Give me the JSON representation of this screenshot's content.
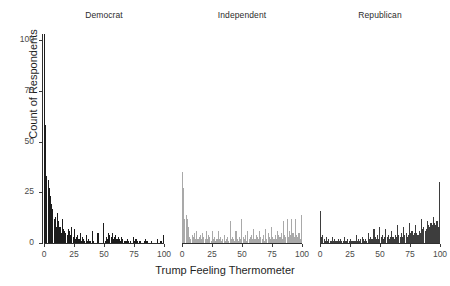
{
  "chart_data": {
    "type": "bar",
    "title": "",
    "xlabel": "Trump Feeling Thermometer",
    "ylabel": "Count of Respondents",
    "ylim": [
      0,
      103
    ],
    "xlim": [
      0,
      100
    ],
    "yticks": [
      0,
      25,
      50,
      75,
      100
    ],
    "xticks": [
      0,
      25,
      50,
      75,
      100
    ],
    "grid": false,
    "legend": "none",
    "facet_layout": "1x3 columns, shared y-axis",
    "panels": [
      {
        "label": "Democrat",
        "color": "#1c1c1c",
        "x": [
          0,
          1,
          2,
          3,
          4,
          5,
          6,
          7,
          8,
          9,
          10,
          11,
          12,
          13,
          14,
          15,
          16,
          17,
          18,
          19,
          20,
          21,
          22,
          23,
          24,
          25,
          26,
          27,
          28,
          29,
          30,
          31,
          32,
          33,
          34,
          35,
          36,
          37,
          38,
          39,
          40,
          41,
          42,
          43,
          44,
          45,
          46,
          47,
          48,
          49,
          50,
          51,
          52,
          53,
          54,
          55,
          56,
          57,
          58,
          59,
          60,
          61,
          62,
          63,
          64,
          65,
          66,
          67,
          68,
          69,
          70,
          71,
          72,
          73,
          74,
          75,
          76,
          77,
          78,
          79,
          80,
          81,
          82,
          83,
          84,
          85,
          86,
          87,
          88,
          89,
          90,
          91,
          92,
          93,
          94,
          95,
          96,
          97,
          98,
          99,
          100
        ],
        "values": [
          103,
          58,
          33,
          31,
          27,
          23,
          19,
          17,
          12,
          13,
          8,
          15,
          11,
          8,
          5,
          12,
          7,
          6,
          5,
          4,
          7,
          6,
          4,
          8,
          3,
          7,
          2,
          3,
          4,
          2,
          5,
          1,
          3,
          2,
          1,
          4,
          1,
          2,
          1,
          1,
          6,
          1,
          0,
          0,
          0,
          5,
          0,
          0,
          0,
          0,
          10,
          1,
          3,
          2,
          5,
          4,
          3,
          5,
          2,
          3,
          4,
          2,
          3,
          2,
          1,
          3,
          2,
          1,
          1,
          1,
          2,
          1,
          1,
          0,
          0,
          3,
          1,
          2,
          1,
          0,
          1,
          1,
          0,
          0,
          1,
          2,
          1,
          1,
          0,
          0,
          1,
          0,
          0,
          0,
          0,
          2,
          0,
          0,
          1,
          0,
          4
        ]
      },
      {
        "label": "Independent",
        "color": "#a9a9a9",
        "x": [
          0,
          1,
          2,
          3,
          4,
          5,
          6,
          7,
          8,
          9,
          10,
          11,
          12,
          13,
          14,
          15,
          16,
          17,
          18,
          19,
          20,
          21,
          22,
          23,
          24,
          25,
          26,
          27,
          28,
          29,
          30,
          31,
          32,
          33,
          34,
          35,
          36,
          37,
          38,
          39,
          40,
          41,
          42,
          43,
          44,
          45,
          46,
          47,
          48,
          49,
          50,
          51,
          52,
          53,
          54,
          55,
          56,
          57,
          58,
          59,
          60,
          61,
          62,
          63,
          64,
          65,
          66,
          67,
          68,
          69,
          70,
          71,
          72,
          73,
          74,
          75,
          76,
          77,
          78,
          79,
          80,
          81,
          82,
          83,
          84,
          85,
          86,
          87,
          88,
          89,
          90,
          91,
          92,
          93,
          94,
          95,
          96,
          97,
          98,
          99,
          100
        ],
        "values": [
          35,
          27,
          12,
          14,
          12,
          8,
          3,
          2,
          4,
          3,
          5,
          2,
          6,
          2,
          3,
          4,
          2,
          5,
          3,
          2,
          6,
          2,
          4,
          3,
          1,
          6,
          2,
          3,
          1,
          2,
          6,
          2,
          3,
          1,
          2,
          4,
          1,
          2,
          3,
          1,
          11,
          2,
          3,
          2,
          1,
          6,
          2,
          1,
          3,
          2,
          12,
          3,
          2,
          4,
          1,
          6,
          2,
          3,
          4,
          2,
          7,
          2,
          4,
          3,
          2,
          6,
          3,
          2,
          4,
          1,
          7,
          2,
          5,
          3,
          2,
          8,
          3,
          2,
          4,
          2,
          6,
          4,
          3,
          5,
          2,
          11,
          4,
          3,
          12,
          3,
          6,
          4,
          12,
          5,
          3,
          12,
          4,
          3,
          5,
          2,
          14
        ]
      },
      {
        "label": "Republican",
        "color": "#3d3d3d",
        "x": [
          0,
          1,
          2,
          3,
          4,
          5,
          6,
          7,
          8,
          9,
          10,
          11,
          12,
          13,
          14,
          15,
          16,
          17,
          18,
          19,
          20,
          21,
          22,
          23,
          24,
          25,
          26,
          27,
          28,
          29,
          30,
          31,
          32,
          33,
          34,
          35,
          36,
          37,
          38,
          39,
          40,
          41,
          42,
          43,
          44,
          45,
          46,
          47,
          48,
          49,
          50,
          51,
          52,
          53,
          54,
          55,
          56,
          57,
          58,
          59,
          60,
          61,
          62,
          63,
          64,
          65,
          66,
          67,
          68,
          69,
          70,
          71,
          72,
          73,
          74,
          75,
          76,
          77,
          78,
          79,
          80,
          81,
          82,
          83,
          84,
          85,
          86,
          87,
          88,
          89,
          90,
          91,
          92,
          93,
          94,
          95,
          96,
          97,
          98,
          99,
          100
        ],
        "values": [
          16,
          3,
          4,
          2,
          1,
          3,
          1,
          2,
          1,
          1,
          3,
          1,
          2,
          1,
          1,
          2,
          1,
          2,
          1,
          1,
          3,
          1,
          1,
          2,
          1,
          2,
          1,
          1,
          1,
          1,
          4,
          1,
          2,
          1,
          2,
          3,
          2,
          1,
          2,
          1,
          5,
          2,
          3,
          2,
          2,
          7,
          3,
          2,
          4,
          2,
          8,
          3,
          4,
          2,
          3,
          7,
          3,
          4,
          2,
          3,
          6,
          3,
          2,
          4,
          3,
          9,
          4,
          3,
          5,
          3,
          8,
          4,
          5,
          3,
          4,
          10,
          5,
          6,
          4,
          5,
          9,
          5,
          4,
          6,
          5,
          12,
          7,
          8,
          6,
          7,
          11,
          9,
          8,
          10,
          9,
          13,
          10,
          9,
          11,
          8,
          30
        ]
      }
    ]
  }
}
